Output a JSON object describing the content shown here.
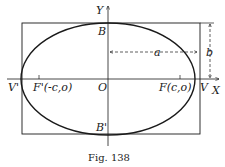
{
  "figure": {
    "caption": "Fig. 138",
    "axes": {
      "x_label": "X",
      "y_label": "Y",
      "origin_label": "O"
    },
    "vertices": {
      "right": "V",
      "left": "V'"
    },
    "covertices": {
      "top": "B",
      "bottom": "B'"
    },
    "foci": {
      "right": "F(c,o)",
      "left": "F'(-c,o)"
    },
    "dimensions": {
      "semi_major": "a",
      "semi_minor": "b"
    },
    "colors": {
      "stroke": "#1a1a1a",
      "background": "#ffffff"
    }
  }
}
